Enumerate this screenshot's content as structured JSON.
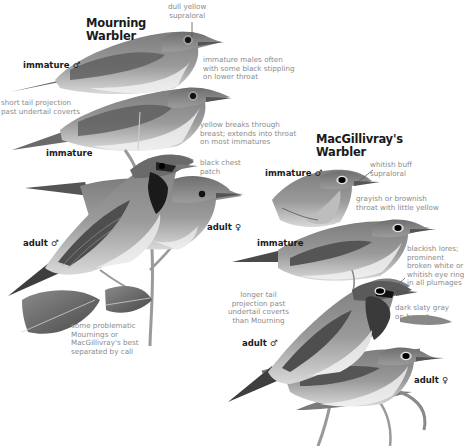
{
  "plate": {
    "background": "#ffffff",
    "mourning": {
      "title_line1": "Mourning",
      "title_line2": "Warbler",
      "labels": {
        "immature_male": "immature ♂",
        "immature": "immature",
        "adult_male": "adult ♂",
        "adult_female": "adult ♀"
      },
      "notes": {
        "supraloral": [
          "dull yellow",
          "supraloral"
        ],
        "immature_males": [
          "immature males often",
          "with some black stippling",
          "on lower throat"
        ],
        "tail_projection": [
          "short tail projection",
          "past undertail coverts"
        ],
        "yellow_breaks": [
          "yellow breaks through",
          "breast; extends into throat",
          "on most immatures"
        ],
        "chest_patch": [
          "black chest",
          "patch"
        ],
        "problematic": [
          "some problematic",
          "Mournings or",
          "MacGillivray's best",
          "separated by call"
        ]
      }
    },
    "macgillivrays": {
      "title_line1": "MacGillivray's",
      "title_line2": "Warbler",
      "labels": {
        "immature_male": "immature ♂",
        "immature": "immature",
        "adult_male": "adult ♂",
        "adult_female": "adult ♀"
      },
      "notes": {
        "supraloral": [
          "whitish buff",
          "supraloral"
        ],
        "throat": [
          "grayish or brownish",
          "throat with little yellow"
        ],
        "lores": [
          "blackish lores;",
          "prominent",
          "broken white or",
          "whitish eye ring",
          "in all plumages"
        ],
        "tail_projection": [
          "longer tail",
          "projection past",
          "undertail coverts",
          "than Mourning"
        ],
        "breast": [
          "dark slaty gray",
          "on breast"
        ]
      }
    },
    "icons": {
      "male_symbol": "♂",
      "female_symbol": "♀"
    }
  }
}
